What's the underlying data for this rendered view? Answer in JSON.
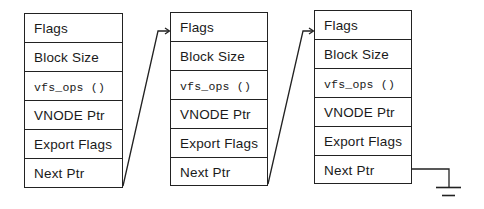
{
  "diagram": {
    "structs": [
      {
        "fields": [
          "Flags",
          "Block Size",
          "vfs_ops ()",
          "VNODE Ptr",
          "Export Flags",
          "Next Ptr"
        ]
      },
      {
        "fields": [
          "Flags",
          "Block Size",
          "vfs_ops ()",
          "VNODE Ptr",
          "Export Flags",
          "Next Ptr"
        ]
      },
      {
        "fields": [
          "Flags",
          "Block Size",
          "vfs_ops ()",
          "VNODE Ptr",
          "Export Flags",
          "Next Ptr"
        ]
      }
    ],
    "links": [
      {
        "from": "struct-1.next-ptr",
        "to": "struct-2.flags"
      },
      {
        "from": "struct-2.next-ptr",
        "to": "struct-3.flags"
      },
      {
        "from": "struct-3.next-ptr",
        "to": "null-ground"
      }
    ],
    "terminator": "ground-symbol",
    "line_color": "#222222",
    "background": "#ffffff"
  }
}
